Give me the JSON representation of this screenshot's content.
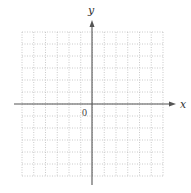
{
  "diagram": {
    "type": "coordinate-plane",
    "x_axis_label": "x",
    "y_axis_label": "y",
    "origin_label": "0",
    "grid": {
      "columns": 12,
      "rows": 12,
      "left_px": 22,
      "top_px": 32,
      "right_px": 163,
      "bottom_px": 176,
      "style": "dotted",
      "color": "#bdbdbd"
    },
    "origin_px": {
      "x": 92,
      "y": 104
    },
    "x_axis": {
      "from_px": 14,
      "to_px": 176,
      "color": "#555555"
    },
    "y_axis": {
      "from_px": 185,
      "to_px": 20,
      "color": "#555555"
    }
  }
}
